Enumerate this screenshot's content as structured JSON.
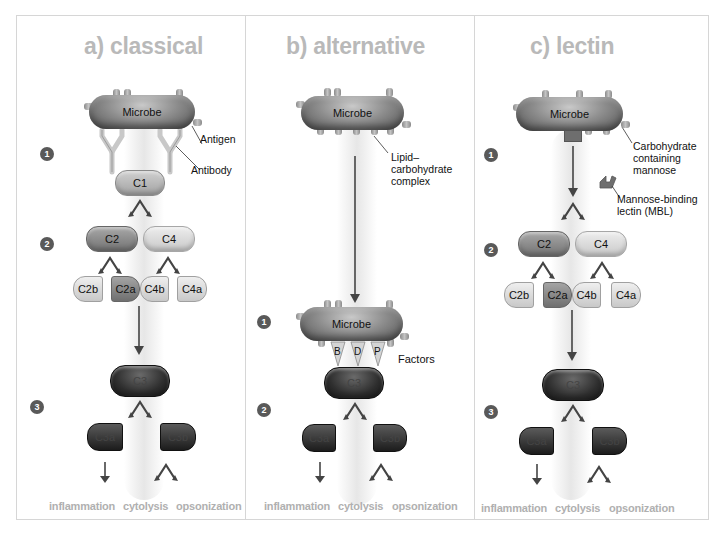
{
  "figure": {
    "panels": [
      {
        "id": "classical",
        "title": "a) classical",
        "microbe_label": "Microbe",
        "annotations": [
          "Antigen",
          "Antibody"
        ],
        "steps": [
          "1",
          "2",
          "3"
        ],
        "components": {
          "c1": "C1",
          "c2": "C2",
          "c4": "C4",
          "c2b": "C2b",
          "c2a": "C2a",
          "c4b": "C4b",
          "c4a": "C4a",
          "c3": "C3",
          "c3a": "C3a",
          "c3b": "C3b"
        },
        "outcomes": [
          "inflammation",
          "cytolysis",
          "opsonization"
        ]
      },
      {
        "id": "alternative",
        "title": "b) alternative",
        "microbe_label": "Microbe",
        "annotations": [
          "Lipid–",
          "carbohydrate",
          "complex",
          "Factors"
        ],
        "factors": [
          "B",
          "D",
          "P"
        ],
        "steps": [
          "1",
          "2"
        ],
        "components": {
          "c3": "C3",
          "c3a": "C3a",
          "c3b": "C3b"
        },
        "outcomes": [
          "inflammation",
          "cytolysis",
          "opsonization"
        ]
      },
      {
        "id": "lectin",
        "title": "c) lectin",
        "microbe_label": "Microbe",
        "annotations": [
          "Carbohydrate",
          "containing",
          "mannose",
          "Mannose-binding",
          "lectin (MBL)"
        ],
        "steps": [
          "1",
          "2",
          "3"
        ],
        "components": {
          "c2": "C2",
          "c4": "C4",
          "c2b": "C2b",
          "c2a": "C2a",
          "c4b": "C4b",
          "c4a": "C4a",
          "c3": "C3",
          "c3a": "C3a",
          "c3b": "C3b"
        },
        "outcomes": [
          "inflammation",
          "cytolysis",
          "opsonization"
        ]
      }
    ],
    "colors": {
      "title_gray": "#b9b9b9",
      "outcome_gray": "#b0b0b0",
      "step_badge": "#595959",
      "arrow": "#444444",
      "border": "#d6d6d6"
    }
  }
}
